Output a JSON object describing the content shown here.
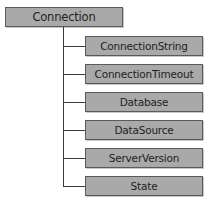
{
  "diagram": {
    "type": "tree",
    "root": {
      "label": "Connection"
    },
    "children": [
      {
        "label": "ConnectionString"
      },
      {
        "label": "ConnectionTimeout"
      },
      {
        "label": "Database"
      },
      {
        "label": "DataSource"
      },
      {
        "label": "ServerVersion"
      },
      {
        "label": "State"
      }
    ],
    "colors": {
      "box_fill": "#a9a9a9",
      "box_border": "#5a5a5a",
      "line": "#3a3a3a",
      "text": "#1e1e1e"
    }
  }
}
